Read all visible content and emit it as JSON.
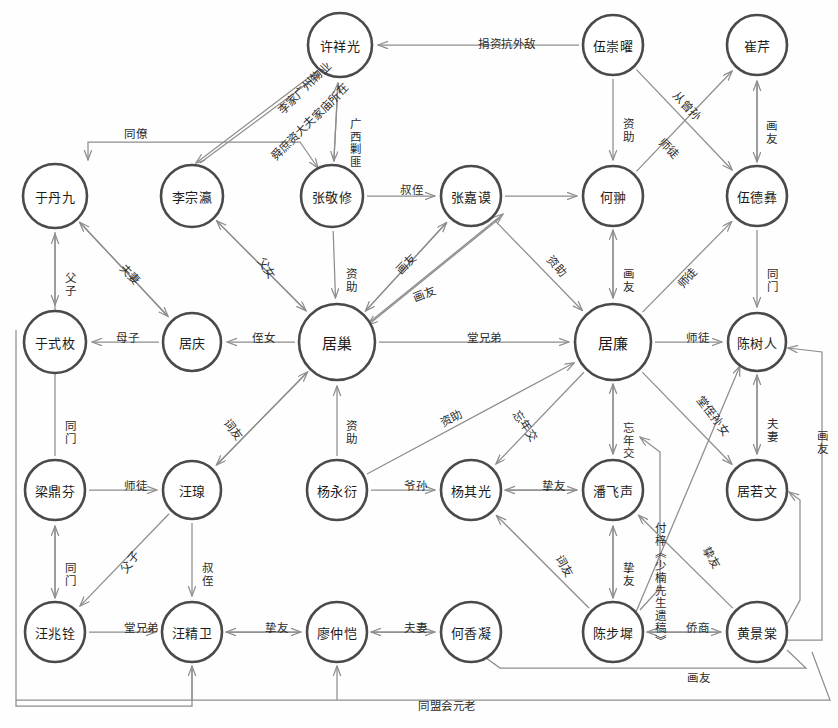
{
  "diagram": {
    "type": "social-network-graph",
    "title": "",
    "canvas": {
      "width": 838,
      "height": 728
    },
    "style": {
      "node_stroke": "#4a4a4a",
      "node_fill": "#ffffff",
      "edge_stroke": "#8d8d8d",
      "label_color": "#2b2b2b",
      "background": "#fefefe"
    },
    "nodes": [
      {
        "id": "xuxiangguang",
        "label": "许祥光",
        "x": 340,
        "y": 45,
        "rx": 32,
        "ry": 32,
        "thick": true
      },
      {
        "id": "wuchongyao",
        "label": "伍崇曜",
        "x": 613,
        "y": 45,
        "rx": 30,
        "ry": 30,
        "thick": true
      },
      {
        "id": "cuiqin",
        "label": "崔芹",
        "x": 757,
        "y": 45,
        "rx": 30,
        "ry": 30,
        "thick": true
      },
      {
        "id": "yudanjiu",
        "label": "于丹九",
        "x": 55,
        "y": 196,
        "rx": 32,
        "ry": 32,
        "thick": true
      },
      {
        "id": "lizongying",
        "label": "李宗瀛",
        "x": 192,
        "y": 196,
        "rx": 31,
        "ry": 31,
        "thick": true
      },
      {
        "id": "zhangjingxiu",
        "label": "张敬修",
        "x": 332,
        "y": 196,
        "rx": 31,
        "ry": 31,
        "thick": true
      },
      {
        "id": "zhangjiamo",
        "label": "张嘉谟",
        "x": 471,
        "y": 196,
        "rx": 30,
        "ry": 30,
        "thick": true
      },
      {
        "id": "hechong",
        "label": "何翀",
        "x": 613,
        "y": 196,
        "rx": 30,
        "ry": 30,
        "thick": true
      },
      {
        "id": "wudeyi",
        "label": "伍德彝",
        "x": 757,
        "y": 196,
        "rx": 30,
        "ry": 30,
        "thick": true
      },
      {
        "id": "yushimei",
        "label": "于式枚",
        "x": 55,
        "y": 342,
        "rx": 31,
        "ry": 31,
        "thick": true
      },
      {
        "id": "juqing",
        "label": "居庆",
        "x": 192,
        "y": 342,
        "rx": 29,
        "ry": 29,
        "thick": true
      },
      {
        "id": "juchao",
        "label": "居巢",
        "x": 337,
        "y": 342,
        "rx": 38,
        "ry": 38,
        "thick": true
      },
      {
        "id": "julian",
        "label": "居廉",
        "x": 613,
        "y": 342,
        "rx": 38,
        "ry": 38,
        "thick": true
      },
      {
        "id": "chenshuren",
        "label": "陈树人",
        "x": 757,
        "y": 342,
        "rx": 29,
        "ry": 29,
        "thick": true
      },
      {
        "id": "liangdingfen",
        "label": "梁鼎芬",
        "x": 55,
        "y": 490,
        "rx": 30,
        "ry": 30,
        "thick": true
      },
      {
        "id": "wangquan",
        "label": "汪瑔",
        "x": 192,
        "y": 490,
        "rx": 29,
        "ry": 29,
        "thick": true
      },
      {
        "id": "yangyongyan",
        "label": "杨永衍",
        "x": 337,
        "y": 490,
        "rx": 30,
        "ry": 30,
        "thick": true
      },
      {
        "id": "yangqiguang",
        "label": "杨其光",
        "x": 471,
        "y": 490,
        "rx": 30,
        "ry": 30,
        "thick": true
      },
      {
        "id": "panfeisheng",
        "label": "潘飞声",
        "x": 613,
        "y": 490,
        "rx": 30,
        "ry": 30,
        "thick": true
      },
      {
        "id": "juruowen",
        "label": "居若文",
        "x": 757,
        "y": 490,
        "rx": 30,
        "ry": 30,
        "thick": true
      },
      {
        "id": "wangzhaoquan",
        "label": "汪兆铨",
        "x": 55,
        "y": 632,
        "rx": 30,
        "ry": 30,
        "thick": true
      },
      {
        "id": "wangjingwei",
        "label": "汪精卫",
        "x": 192,
        "y": 632,
        "rx": 30,
        "ry": 30,
        "thick": true
      },
      {
        "id": "liaozhongkai",
        "label": "廖仲恺",
        "x": 337,
        "y": 632,
        "rx": 30,
        "ry": 30,
        "thick": true
      },
      {
        "id": "hexiangning",
        "label": "何香凝",
        "x": 471,
        "y": 632,
        "rx": 30,
        "ry": 30,
        "thick": true
      },
      {
        "id": "chenbuchi",
        "label": "陈步墀",
        "x": 613,
        "y": 632,
        "rx": 30,
        "ry": 30,
        "thick": true
      },
      {
        "id": "huangjingtang",
        "label": "黄景棠",
        "x": 757,
        "y": 632,
        "rx": 30,
        "ry": 30,
        "thick": true
      }
    ],
    "edge_labels": [
      {
        "text": "捐资抗外敌",
        "x": 478,
        "y": 38,
        "rot": 0,
        "vertical": false
      },
      {
        "text": "广西剿匪",
        "x": 347,
        "y": 118,
        "rot": 0,
        "vertical": true
      },
      {
        "text": "李家广州物业",
        "x": 270,
        "y": 82,
        "rot": -45,
        "vertical": false
      },
      {
        "text": "舜庶资大夫家庙所在",
        "x": 258,
        "y": 116,
        "rot": -45,
        "vertical": false
      },
      {
        "text": "同僚",
        "x": 124,
        "y": 128,
        "rot": 0,
        "vertical": false
      },
      {
        "text": "资助",
        "x": 620,
        "y": 118,
        "rot": 0,
        "vertical": true
      },
      {
        "text": "从曾孙",
        "x": 670,
        "y": 100,
        "rot": 46,
        "vertical": false
      },
      {
        "text": "师徒",
        "x": 657,
        "y": 142,
        "rot": 46,
        "vertical": false
      },
      {
        "text": "画友",
        "x": 763,
        "y": 120,
        "rot": 0,
        "vertical": true
      },
      {
        "text": "叔侄",
        "x": 400,
        "y": 184,
        "rot": 0,
        "vertical": false
      },
      {
        "text": "父女",
        "x": 255,
        "y": 262,
        "rot": 56,
        "vertical": false
      },
      {
        "text": "夫妻",
        "x": 118,
        "y": 268,
        "rot": 46,
        "vertical": false
      },
      {
        "text": "父子",
        "x": 62,
        "y": 272,
        "rot": 0,
        "vertical": true
      },
      {
        "text": "资助",
        "x": 343,
        "y": 268,
        "rot": 0,
        "vertical": true
      },
      {
        "text": "画友",
        "x": 395,
        "y": 258,
        "rot": -46,
        "vertical": false
      },
      {
        "text": "画友",
        "x": 413,
        "y": 288,
        "rot": -22,
        "vertical": false
      },
      {
        "text": "资助",
        "x": 545,
        "y": 260,
        "rot": 48,
        "vertical": false
      },
      {
        "text": "画友",
        "x": 620,
        "y": 268,
        "rot": 0,
        "vertical": true
      },
      {
        "text": "师徒",
        "x": 676,
        "y": 272,
        "rot": -48,
        "vertical": false
      },
      {
        "text": "同门",
        "x": 764,
        "y": 268,
        "rot": 0,
        "vertical": true
      },
      {
        "text": "母子",
        "x": 116,
        "y": 332,
        "rot": 0,
        "vertical": false
      },
      {
        "text": "侄女",
        "x": 252,
        "y": 332,
        "rot": 0,
        "vertical": false
      },
      {
        "text": "堂兄弟",
        "x": 467,
        "y": 332,
        "rot": 0,
        "vertical": false
      },
      {
        "text": "师徒",
        "x": 686,
        "y": 332,
        "rot": 0,
        "vertical": false
      },
      {
        "text": "同门",
        "x": 62,
        "y": 420,
        "rot": 0,
        "vertical": true
      },
      {
        "text": "词友",
        "x": 222,
        "y": 424,
        "rot": 52,
        "vertical": false
      },
      {
        "text": "资助",
        "x": 343,
        "y": 420,
        "rot": 0,
        "vertical": true
      },
      {
        "text": "资助",
        "x": 440,
        "y": 412,
        "rot": -28,
        "vertical": false
      },
      {
        "text": "忘年交",
        "x": 508,
        "y": 420,
        "rot": 56,
        "vertical": false
      },
      {
        "text": "忘年交",
        "x": 620,
        "y": 422,
        "rot": 0,
        "vertical": true
      },
      {
        "text": "堂侄孙女",
        "x": 690,
        "y": 410,
        "rot": 52,
        "vertical": false
      },
      {
        "text": "夫妻",
        "x": 764,
        "y": 418,
        "rot": 0,
        "vertical": true
      },
      {
        "text": "画友",
        "x": 814,
        "y": 430,
        "rot": 0,
        "vertical": true
      },
      {
        "text": "付梓《少楠先生遗稿》",
        "x": 652,
        "y": 522,
        "rot": 0,
        "vertical": true
      },
      {
        "text": "师徒",
        "x": 124,
        "y": 480,
        "rot": 0,
        "vertical": false
      },
      {
        "text": "爷孙",
        "x": 404,
        "y": 480,
        "rot": 0,
        "vertical": false
      },
      {
        "text": "挚友",
        "x": 542,
        "y": 480,
        "rot": 0,
        "vertical": false
      },
      {
        "text": "同门",
        "x": 62,
        "y": 562,
        "rot": 0,
        "vertical": true
      },
      {
        "text": "父子",
        "x": 118,
        "y": 556,
        "rot": -52,
        "vertical": false
      },
      {
        "text": "叔侄",
        "x": 199,
        "y": 562,
        "rot": 0,
        "vertical": true
      },
      {
        "text": "词友",
        "x": 553,
        "y": 560,
        "rot": 60,
        "vertical": false
      },
      {
        "text": "挚友",
        "x": 620,
        "y": 562,
        "rot": 0,
        "vertical": true
      },
      {
        "text": "挚友",
        "x": 700,
        "y": 552,
        "rot": 58,
        "vertical": false
      },
      {
        "text": "堂兄弟",
        "x": 124,
        "y": 622,
        "rot": 0,
        "vertical": false
      },
      {
        "text": "挚友",
        "x": 265,
        "y": 622,
        "rot": 0,
        "vertical": false
      },
      {
        "text": "夫妻",
        "x": 404,
        "y": 622,
        "rot": 0,
        "vertical": false
      },
      {
        "text": "侨商",
        "x": 686,
        "y": 622,
        "rot": 0,
        "vertical": false
      },
      {
        "text": "画友",
        "x": 687,
        "y": 672,
        "rot": 0,
        "vertical": false
      },
      {
        "text": "同盟会元老",
        "x": 418,
        "y": 700,
        "rot": 0,
        "vertical": false
      }
    ]
  }
}
